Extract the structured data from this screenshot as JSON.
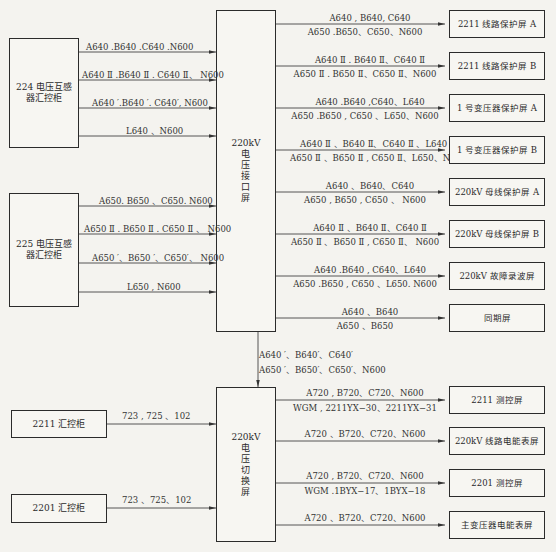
{
  "diagram": {
    "title_fragment": "",
    "sources_top": [
      {
        "id": "pt224",
        "label": "224 电压互感器汇控柜"
      },
      {
        "id": "pt225",
        "label": "225 电压互感器汇控柜"
      }
    ],
    "interface_panel": {
      "label_top": "220kV",
      "label_chars": [
        "电",
        "压",
        "接",
        "口",
        "屏"
      ]
    },
    "switch_panel": {
      "label_top": "220kV",
      "label_chars": [
        "电",
        "压",
        "切",
        "换",
        "屏"
      ]
    },
    "inputs_224": [
      "A640 .B640 .C640 .N600",
      "A640 Ⅱ .B640 Ⅱ . C640 Ⅱ、 N600",
      "A640 ′.B640 ′. C640′, N600",
      "L640 、N600"
    ],
    "inputs_225": [
      "A650. B650 、C650. N600",
      "A650 Ⅱ . B650 Ⅱ . C650 Ⅱ 、 N600",
      "A650 ′、B650 ′、C650′、 N600",
      "L650 , N600"
    ],
    "interface_to_switch": {
      "line1": "A640 ′、B640′、C640′",
      "line2": "A650 ′、B650′、C650′、N600"
    },
    "outputs_interface": [
      {
        "top": "A640 , B640, C640",
        "bottom": "A650 .B650、C650、N600",
        "target": "2211 线路保护屏 A"
      },
      {
        "top": "A640 Ⅱ . B640 Ⅱ、C640 Ⅱ",
        "bottom": "A650 Ⅱ . B650 Ⅱ、C650 Ⅱ、N600",
        "target": "2211 线路保护屏 B"
      },
      {
        "top": "A640 .B640 ,C640、L640",
        "bottom": "A650 .B650 , C650 、L650、N600",
        "target": "1 号变压器保护屏 A"
      },
      {
        "top": "A640 Ⅱ 、B640 Ⅱ、C640 Ⅱ 、L640",
        "bottom": "A650 Ⅱ 、B650 Ⅱ , C650 Ⅱ、L650、N600",
        "target": "1 号变压器保护屏 B"
      },
      {
        "top": "A640 、B640、C640",
        "bottom": "A650 , B650 , C650 、 N600",
        "target": "220kV 母线保护屏 A"
      },
      {
        "top": "A640 Ⅱ 、B640 Ⅱ、C640 Ⅱ",
        "bottom": "A650 Ⅱ 、B650 Ⅱ , C650 Ⅱ、 N600",
        "target": "220kV 母线保护屏 B"
      },
      {
        "top": "A640 .B640 , C640、L640",
        "bottom": "A650 .B650 , C650 、L650. N600",
        "target": "220kV 故障录波屏"
      },
      {
        "top": "A640 、B640",
        "bottom": "A650 、B650",
        "target": "同期屏"
      }
    ],
    "sources_bottom": [
      {
        "id": "c2211",
        "label": "2211 汇控柜",
        "wire": "723 , 725 、102"
      },
      {
        "id": "c2201",
        "label": "2201 汇控柜",
        "wire": "723 、725、102"
      }
    ],
    "outputs_switch": [
      {
        "top": "A720 , B720、C720、N600",
        "bottom": "WGM , 2211YX−30、2211YX−31",
        "target": "2211 测控屏"
      },
      {
        "top": "A720 、B720、C720、N600",
        "bottom": "",
        "target": "220kV 线路电能表屏"
      },
      {
        "top": "A720 , B720、C720、N600",
        "bottom": "WGM .1BYX−17、1BYX−18",
        "target": "2201 测控屏"
      },
      {
        "top": "A720 、B720、C720、N600",
        "bottom": "",
        "target": "主变压器电能表屏"
      }
    ]
  }
}
